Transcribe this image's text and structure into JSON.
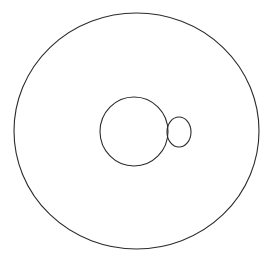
{
  "canvas": {
    "width": 270,
    "height": 258,
    "background_color": "#ffffff",
    "title": "Three overlapping circles line drawing"
  },
  "style": {
    "stroke_color": "#2b2b2b",
    "stroke_width": 1.1,
    "fill": "none",
    "speck_color": "#ececec"
  },
  "chart_data": {
    "type": "diagram",
    "title": "",
    "shapes": [
      {
        "id": "outer-circle",
        "label": "Large outer circle",
        "kind": "ellipse",
        "cx": 136.5,
        "cy": 131.0,
        "rx": 122.5,
        "ry": 118.0,
        "bounds": {
          "left": 14,
          "right": 259,
          "top": 13,
          "bottom": 249
        },
        "stroke": "#2b2b2b",
        "fill": "none"
      },
      {
        "id": "medium-circle",
        "label": "Medium inner circle",
        "kind": "ellipse",
        "cx": 134.0,
        "cy": 131.5,
        "rx": 34.0,
        "ry": 34.5,
        "bounds": {
          "left": 100,
          "right": 168,
          "top": 97,
          "bottom": 166
        },
        "stroke": "#2b2b2b",
        "fill": "none"
      },
      {
        "id": "small-circle",
        "label": "Small overlapping circle",
        "kind": "ellipse",
        "cx": 179.0,
        "cy": 132.0,
        "rx": 12.0,
        "ry": 15.0,
        "bounds": {
          "left": 167,
          "right": 191,
          "top": 117,
          "bottom": 147
        },
        "stroke": "#2b2b2b",
        "fill": "none"
      }
    ],
    "marks": [
      {
        "id": "faint-speck",
        "label": "Faint light-gray speck",
        "kind": "dot",
        "cx": 157.5,
        "cy": 65.0,
        "r": 2.2,
        "color": "#ececec"
      }
    ],
    "relations": [
      "medium-circle lies entirely inside outer-circle",
      "small-circle overlaps the right edge of medium-circle",
      "small-circle lies entirely inside outer-circle"
    ]
  }
}
